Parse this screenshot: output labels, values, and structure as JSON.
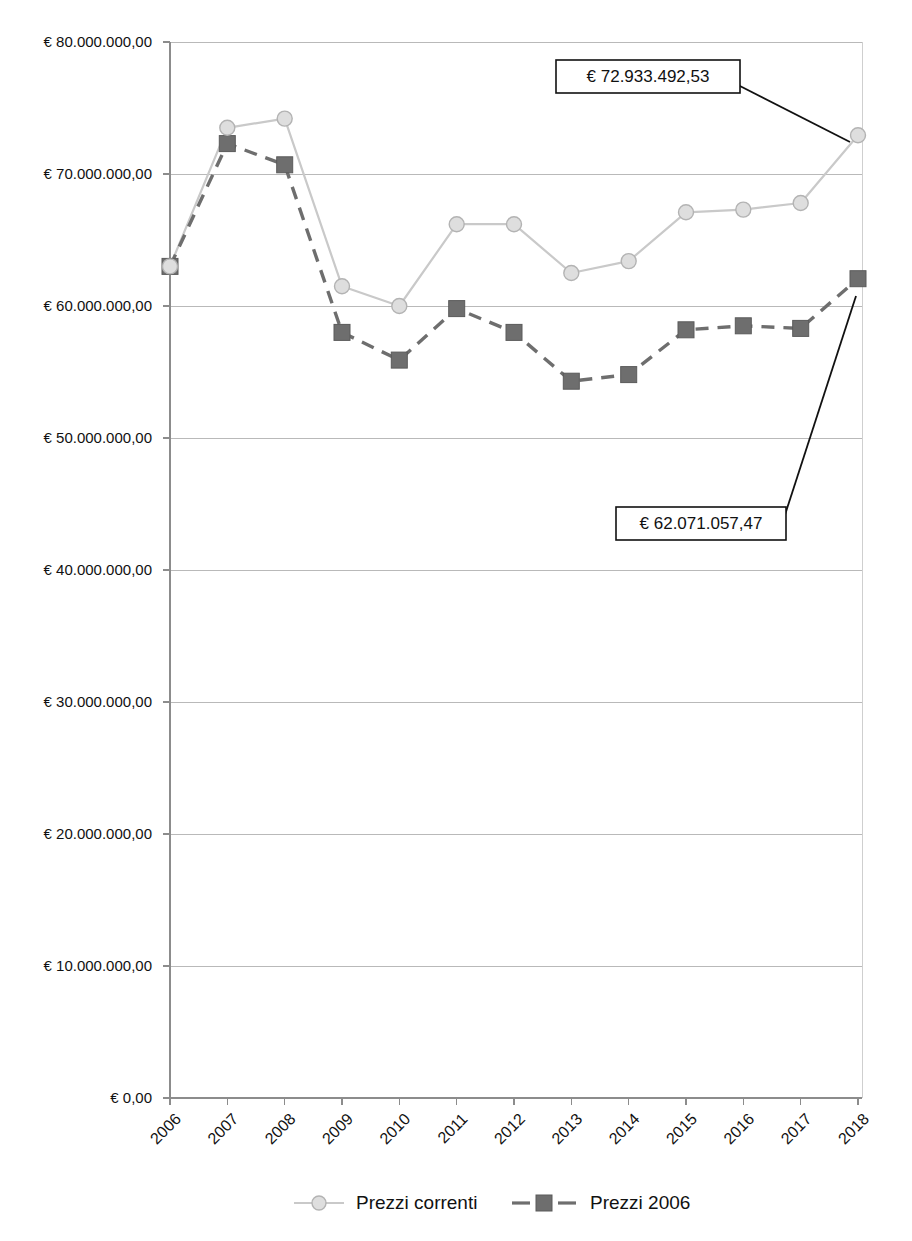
{
  "chart_data": {
    "type": "line",
    "title": "",
    "subtitle": "",
    "xlabel": "",
    "ylabel": "",
    "categories": [
      "2006",
      "2007",
      "2008",
      "2009",
      "2010",
      "2011",
      "2012",
      "2013",
      "2014",
      "2015",
      "2016",
      "2017",
      "2018"
    ],
    "ylim": [
      0,
      80000000
    ],
    "ytick_values": [
      0,
      10000000,
      20000000,
      30000000,
      40000000,
      50000000,
      60000000,
      70000000,
      80000000
    ],
    "ytick_labels": [
      "€ 0,00",
      "€ 10.000.000,00",
      "€ 20.000.000,00",
      "€ 30.000.000,00",
      "€ 40.000.000,00",
      "€ 50.000.000,00",
      "€ 60.000.000,00",
      "€ 70.000.000,00",
      "€ 80.000.000,00"
    ],
    "grid": true,
    "legend_position": "bottom",
    "series": [
      {
        "name": "Prezzi correnti",
        "color": "#c9c9c9",
        "marker": "circle",
        "style": "solid",
        "values": [
          63000000,
          73500000,
          74200000,
          61500000,
          60000000,
          66200000,
          66200000,
          62500000,
          63400000,
          67100000,
          67300000,
          67800000,
          72933492.53
        ]
      },
      {
        "name": "Prezzi 2006",
        "color": "#6e6e6e",
        "marker": "square",
        "style": "dashed",
        "values": [
          63000000,
          72300000,
          70700000,
          58000000,
          55900000,
          59800000,
          58000000,
          54300000,
          54800000,
          58200000,
          58500000,
          58300000,
          62071057.47
        ]
      }
    ],
    "annotations": [
      {
        "label": "€ 72.933.492,53",
        "series": "Prezzi correnti",
        "category": "2018",
        "value": 72933492.53
      },
      {
        "label": "€ 62.071.057,47",
        "series": "Prezzi 2006",
        "category": "2018",
        "value": 62071057.47
      }
    ]
  },
  "legend": {
    "items": [
      {
        "label": "Prezzi correnti"
      },
      {
        "label": "Prezzi 2006"
      }
    ]
  },
  "axis": {
    "y_labels": [
      "€ 80.000.000,00",
      "€ 70.000.000,00",
      "€ 60.000.000,00",
      "€ 50.000.000,00",
      "€ 40.000.000,00",
      "€ 30.000.000,00",
      "€ 20.000.000,00",
      "€ 10.000.000,00",
      "€ 0,00"
    ],
    "x_labels": [
      "2006",
      "2007",
      "2008",
      "2009",
      "2010",
      "2011",
      "2012",
      "2013",
      "2014",
      "2015",
      "2016",
      "2017",
      "2018"
    ]
  },
  "callouts": [
    {
      "label": "€ 72.933.492,53"
    },
    {
      "label": "€ 62.071.057,47"
    }
  ],
  "colors": {
    "series_current": "#c9c9c9",
    "series_base": "#6e6e6e",
    "grid": "#b9b9b9",
    "axis": "#8c8c8c",
    "text": "#111111"
  }
}
